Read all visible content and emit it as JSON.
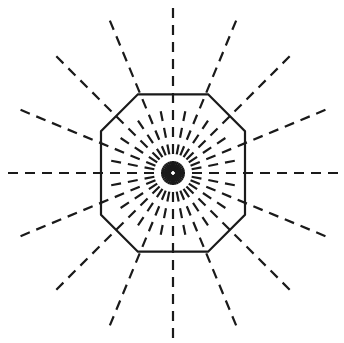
{
  "figure": {
    "type": "geometric-diagram",
    "canvas": {
      "width": 344,
      "height": 343,
      "background": "#ffffff"
    },
    "center": {
      "x": 173,
      "y": 173
    },
    "style": {
      "stroke_color": "#1a1a1a",
      "solid_stroke_width": 2.2,
      "dashed_stroke_width": 2.2,
      "dash_length": 10,
      "gap_length": 7,
      "line_cap": "butt"
    },
    "octagon": {
      "label": "Regular octagon",
      "sides": 8,
      "orientation": "flat-top",
      "circumradius": 54,
      "start_angle_deg": 22.5,
      "filled": false,
      "stroke": "#1a1a1a",
      "vertices": [
        {
          "x": 208.1,
          "y": 94.3
        },
        {
          "x": 245.0,
          "y": 131.3
        },
        {
          "x": 245.0,
          "y": 214.7
        },
        {
          "x": 208.1,
          "y": 251.7
        },
        {
          "x": 137.9,
          "y": 251.7
        },
        {
          "x": 101.0,
          "y": 214.7
        },
        {
          "x": 101.0,
          "y": 131.3
        },
        {
          "x": 137.9,
          "y": 94.3
        }
      ]
    },
    "rays": {
      "label": "Dashed radial rays from center",
      "total_count": 32,
      "angular_step_deg": 11.25,
      "long_ray_count": 16,
      "long_ray_step_deg": 22.5,
      "long_ray_radius": 168,
      "short_ray_count": 16,
      "short_ray_radius": 68,
      "inner_start_radius": 2,
      "long_ray_angles_deg": [
        0,
        22.5,
        45,
        67.5,
        90,
        112.5,
        135,
        157.5,
        180,
        202.5,
        225,
        247.5,
        270,
        292.5,
        315,
        337.5
      ],
      "short_ray_angles_deg": [
        11.25,
        33.75,
        56.25,
        78.75,
        101.25,
        123.75,
        146.25,
        168.75,
        191.25,
        213.75,
        236.25,
        258.75,
        281.25,
        303.75,
        326.25,
        348.75
      ]
    }
  }
}
